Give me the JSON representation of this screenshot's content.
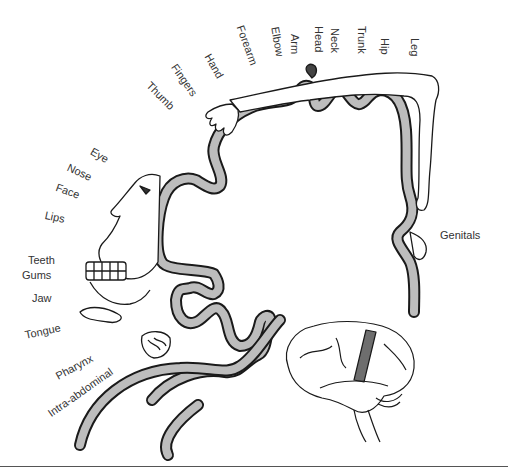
{
  "diagram": {
    "colors": {
      "cortex_fill": "#bdbdbd",
      "outline": "#1a1a1a",
      "label": "#333333",
      "motor_strip": "#6e6e6e"
    },
    "labels": {
      "leg": "Leg",
      "hip": "Hip",
      "trunk": "Trunk",
      "neck": "Neck",
      "head": "Head",
      "arm": "Arm",
      "elbow": "Elbow",
      "forearm": "Forearm",
      "hand": "Hand",
      "fingers": "Fingers",
      "thumb": "Thumb",
      "eye": "Eye",
      "nose": "Nose",
      "face": "Face",
      "lips": "Lips",
      "teeth": "Teeth",
      "gums": "Gums",
      "jaw": "Jaw",
      "tongue": "Tongue",
      "pharynx": "Pharynx",
      "intra_abdominal": "Intra-abdominal",
      "genitals": "Genitals"
    },
    "inset": {
      "name": "brain-lateral-view",
      "highlight": "postcentral-gyrus"
    }
  }
}
